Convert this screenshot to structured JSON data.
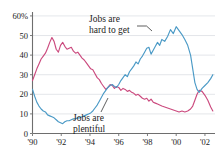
{
  "chart_data": {
    "type": "line",
    "title": "",
    "subtitle": "",
    "xlabel": "",
    "ylabel": "",
    "xlim": [
      1990.0,
      2002.7
    ],
    "ylim": [
      0,
      62
    ],
    "grid": true,
    "grid_axis": "y",
    "legend_position": "inline-annotations",
    "y_ticks": [
      0,
      10,
      20,
      30,
      40,
      50,
      60
    ],
    "y_tick_labels": [
      "0",
      "10",
      "20",
      "30",
      "40",
      "50",
      "60%"
    ],
    "x_ticks": [
      1990,
      1992,
      1994,
      1996,
      1998,
      2000,
      2002
    ],
    "x_tick_labels": [
      "'90",
      "'92",
      "'94",
      "'96",
      "'98",
      "'00",
      "'02"
    ],
    "annotations": [
      {
        "name": "jobs-hard-to-get-label",
        "text_line1": "Jobs are",
        "text_line2": "hard to get",
        "points_to_series": "Jobs are hard to get"
      },
      {
        "name": "jobs-plentiful-label",
        "text_line1": "Jobs are",
        "text_line2": "plentiful",
        "points_to_series": "Jobs are plentiful"
      }
    ],
    "series": [
      {
        "name": "Jobs are plentiful",
        "color": "#cb4a7e",
        "x": [
          1990.0,
          1990.15,
          1990.3,
          1990.45,
          1990.6,
          1990.75,
          1990.9,
          1991.05,
          1991.2,
          1991.35,
          1991.5,
          1991.65,
          1991.8,
          1991.95,
          1992.1,
          1992.25,
          1992.4,
          1992.55,
          1992.7,
          1992.85,
          1993.0,
          1993.15,
          1993.3,
          1993.45,
          1993.6,
          1993.75,
          1993.9,
          1994.05,
          1994.2,
          1994.35,
          1994.5,
          1994.65,
          1994.8,
          1994.95,
          1995.1,
          1995.25,
          1995.4,
          1995.55,
          1995.7,
          1995.85,
          1996.0,
          1996.15,
          1996.3,
          1996.45,
          1996.6,
          1996.75,
          1996.9,
          1997.05,
          1997.2,
          1997.35,
          1997.5,
          1997.65,
          1997.8,
          1997.95,
          1998.1,
          1998.25,
          1998.4,
          1998.55,
          1998.7,
          1998.85,
          1999.0,
          1999.2,
          1999.4,
          1999.6,
          1999.8,
          2000.0,
          2000.2,
          2000.4,
          2000.6,
          2000.8,
          2001.0,
          2001.15,
          2001.3,
          2001.45,
          2001.6,
          2001.8,
          2002.0,
          2002.2,
          2002.4,
          2002.55
        ],
        "y": [
          27.0,
          30.0,
          33.0,
          35.5,
          38.0,
          39.5,
          41.0,
          43.5,
          46.5,
          49.0,
          47.0,
          43.0,
          41.5,
          45.0,
          46.5,
          44.5,
          43.0,
          43.5,
          44.0,
          42.0,
          41.0,
          41.5,
          40.0,
          38.5,
          37.5,
          36.0,
          34.5,
          33.0,
          32.5,
          30.5,
          28.5,
          27.5,
          25.5,
          24.0,
          22.5,
          23.5,
          25.0,
          24.5,
          23.0,
          24.0,
          23.5,
          22.0,
          23.0,
          22.5,
          21.5,
          22.0,
          21.0,
          20.5,
          19.5,
          20.0,
          19.0,
          18.0,
          17.5,
          18.0,
          16.5,
          17.5,
          16.0,
          15.5,
          15.0,
          14.5,
          14.0,
          13.5,
          13.0,
          12.5,
          12.0,
          11.5,
          11.0,
          11.5,
          11.0,
          11.5,
          12.5,
          14.0,
          17.0,
          20.0,
          22.0,
          21.5,
          19.5,
          17.0,
          13.5,
          11.5
        ]
      },
      {
        "name": "Jobs are hard to get",
        "color": "#4b9ac6",
        "x": [
          1990.0,
          1990.15,
          1990.3,
          1990.45,
          1990.6,
          1990.75,
          1990.9,
          1991.05,
          1991.2,
          1991.35,
          1991.5,
          1991.65,
          1991.8,
          1991.95,
          1992.1,
          1992.25,
          1992.4,
          1992.55,
          1992.7,
          1992.85,
          1993.0,
          1993.15,
          1993.3,
          1993.45,
          1993.6,
          1993.75,
          1993.9,
          1994.05,
          1994.2,
          1994.35,
          1994.5,
          1994.65,
          1994.8,
          1994.95,
          1995.1,
          1995.25,
          1995.4,
          1995.55,
          1995.7,
          1995.85,
          1996.0,
          1996.15,
          1996.3,
          1996.45,
          1996.6,
          1996.75,
          1996.9,
          1997.05,
          1997.2,
          1997.35,
          1997.5,
          1997.65,
          1997.8,
          1997.95,
          1998.1,
          1998.25,
          1998.4,
          1998.55,
          1998.7,
          1998.85,
          1999.0,
          1999.2,
          1999.4,
          1999.6,
          1999.8,
          2000.0,
          2000.2,
          2000.4,
          2000.6,
          2000.8,
          2001.0,
          2001.15,
          2001.3,
          2001.45,
          2001.6,
          2001.8,
          2002.0,
          2002.2,
          2002.4,
          2002.55
        ],
        "y": [
          22.5,
          19.0,
          16.0,
          14.0,
          12.5,
          11.5,
          11.0,
          9.5,
          9.0,
          8.5,
          8.0,
          7.0,
          6.0,
          5.5,
          5.0,
          6.0,
          6.5,
          6.5,
          7.0,
          7.5,
          7.5,
          8.0,
          8.0,
          8.5,
          9.0,
          9.5,
          10.0,
          10.5,
          11.5,
          13.0,
          14.5,
          16.5,
          18.5,
          20.5,
          22.0,
          23.5,
          24.5,
          25.0,
          24.0,
          23.5,
          25.0,
          27.0,
          28.5,
          30.0,
          29.0,
          31.5,
          33.0,
          34.5,
          36.5,
          35.5,
          38.0,
          39.5,
          41.5,
          43.5,
          44.0,
          40.5,
          42.5,
          44.5,
          46.5,
          45.0,
          48.0,
          47.0,
          49.5,
          53.0,
          51.0,
          54.5,
          52.5,
          50.5,
          48.0,
          45.0,
          40.0,
          33.0,
          26.0,
          22.5,
          21.0,
          23.0,
          24.5,
          26.0,
          28.0,
          30.0
        ]
      }
    ]
  },
  "axis": {
    "y_axis_name": "percent-axis",
    "x_axis_name": "year-axis"
  }
}
